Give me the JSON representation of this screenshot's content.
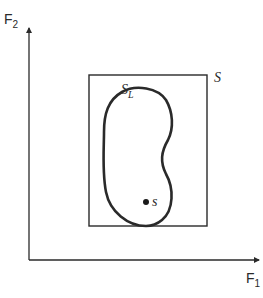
{
  "diagram": {
    "axes": {
      "x_label": "F",
      "x_label_sub": "1",
      "y_label": "F",
      "y_label_sub": "2"
    },
    "set_box": {
      "label": "S"
    },
    "region": {
      "label": "S",
      "label_sub": "L"
    },
    "point": {
      "label": "s"
    },
    "colors": {
      "stroke": "#2a2a2a",
      "background": "#ffffff"
    }
  }
}
